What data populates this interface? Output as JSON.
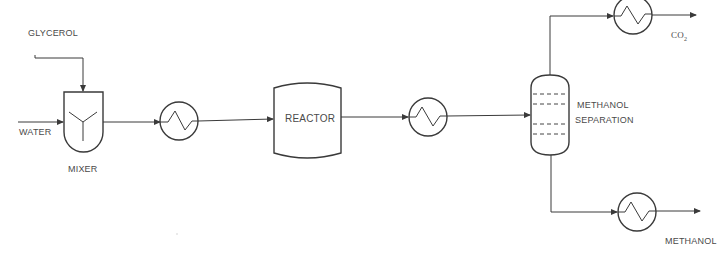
{
  "diagram": {
    "type": "process-flow-diagram",
    "colors": {
      "line": "#3a3a3a",
      "text": "#4a4a4a",
      "background": "#ffffff"
    },
    "streams": {
      "glycerol": "GLYCEROL",
      "water": "WATER",
      "co2": "CO",
      "co2_subscript": "2",
      "methanol": "METHANOL"
    },
    "units": {
      "mixer": "MIXER",
      "reactor": "REACTOR",
      "separation_line1": "METHANOL",
      "separation_line2": "SEPARATION"
    },
    "heat_exchangers": [
      {
        "id": "hx-1",
        "location": "after-mixer"
      },
      {
        "id": "hx-2",
        "location": "after-reactor"
      },
      {
        "id": "hx-3",
        "location": "overhead-co2"
      },
      {
        "id": "hx-4",
        "location": "bottoms-methanol"
      }
    ],
    "flow": [
      "GLYCEROL -> MIXER",
      "WATER -> MIXER",
      "MIXER -> HX-1",
      "HX-1 -> REACTOR",
      "REACTOR -> HX-2",
      "HX-2 -> METHANOL SEPARATION",
      "METHANOL SEPARATION (top) -> HX-3 -> CO2",
      "METHANOL SEPARATION (bottom) -> HX-4 -> METHANOL"
    ]
  }
}
